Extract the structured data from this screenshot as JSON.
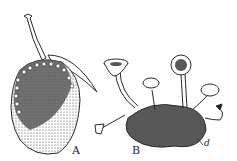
{
  "figure": {
    "label_a": "A",
    "label_b": "B",
    "label_d": "d",
    "ink_color": "#2a2a2a",
    "background": "#ffffff"
  }
}
